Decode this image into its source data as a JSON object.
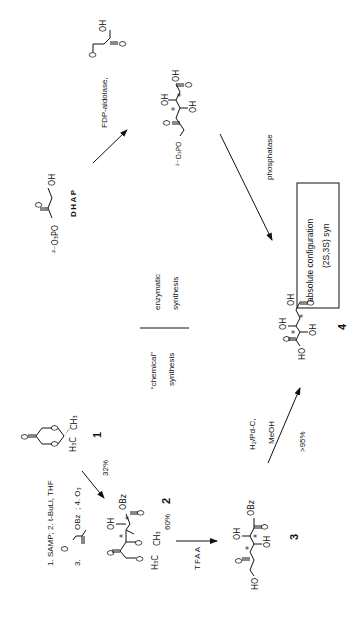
{
  "scheme": {
    "orientation": "rotated 90 degrees counter-clockwise",
    "compounds": {
      "dhap": {
        "label": "DHAP",
        "phosphate": "²⁻O₃PO",
        "ketone_o": "O",
        "hydroxyl": "OH"
      },
      "glyoxylic_acid": {
        "o": "O",
        "oh": "OH",
        "o2": "O"
      },
      "phosphorylated_intermediate": {
        "phosphate": "²⁻O₃PO",
        "o": "O",
        "oh1": "OH",
        "oh2": "OH",
        "cooh_oh": "OH",
        "cooh_o": "O",
        "star": "*"
      },
      "compound_1": {
        "number": "1",
        "o": "O",
        "ring_o": "O",
        "ch3": "CH₃",
        "h3c": "H₃C"
      },
      "compound_2": {
        "number": "2",
        "o": "O",
        "oh": "OH",
        "obz": "OBz",
        "ester_o": "O",
        "ch3": "CH₃",
        "h3c": "H₃C",
        "star": "*"
      },
      "compound_3": {
        "number": "3",
        "ho": "HO",
        "o": "O",
        "oh1": "OH",
        "oh2": "OH",
        "obz": "OBz",
        "ester_o": "O",
        "star": "*"
      },
      "compound_4": {
        "number": "4",
        "ho": "HO",
        "o": "O",
        "oh1": "OH",
        "oh2": "OH",
        "cooh_oh": "OH",
        "cooh_o": "O",
        "star": "*"
      }
    },
    "arrows": {
      "aldolase": {
        "reagent": "FDP-aldolase,"
      },
      "phosphatase": {
        "reagent": "phosphatase"
      },
      "alkylation": {
        "reagents_line1": "1. SAMP; 2. t-BuLi, THF",
        "reagents_line2_prefix": "3.",
        "reagents_line2_suffix": "; 4. O₃",
        "reagent_obz": "OBz",
        "yield": "32%"
      },
      "tfaa": {
        "reagent": "TFAA",
        "yield": "60%"
      },
      "hydrogenolysis": {
        "reagent_line1": "H₂/Pd-C,",
        "reagent_line2": "MeOH",
        "yield": ">95%"
      }
    },
    "divider": {
      "enzymatic_line1": "enzymatic",
      "enzymatic_line2": "synthesis",
      "chemical_line1": "“chemical”",
      "chemical_line2": "synthesis"
    },
    "result_box": {
      "line1": "absolute  configuration",
      "line2": "(2S,3S) syn"
    }
  }
}
